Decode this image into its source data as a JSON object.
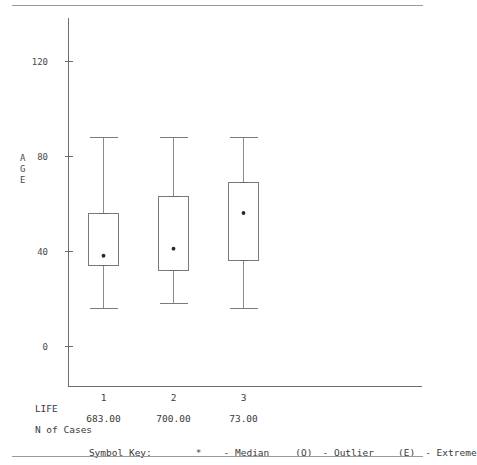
{
  "chart_data": {
    "type": "box",
    "title": "",
    "xlabel": "LIFE",
    "ylabel": "AGE",
    "ylim": [
      -10,
      133
    ],
    "yticks": [
      0,
      40,
      80,
      120
    ],
    "ytick_labels": [
      "0",
      "40",
      "80",
      "120"
    ],
    "categories": [
      "1",
      "2",
      "3"
    ],
    "grid": false,
    "legend_position": "bottom",
    "n_of_cases": [
      "683.00",
      "700.00",
      "73.00"
    ],
    "boxes": [
      {
        "category": "1",
        "whisker_low": 16,
        "q1": 34,
        "median": 38,
        "q3": 56,
        "whisker_high": 88,
        "n": "683.00"
      },
      {
        "category": "2",
        "whisker_low": 18,
        "q1": 32,
        "median": 41,
        "q3": 63,
        "whisker_high": 88,
        "n": "700.00"
      },
      {
        "category": "3",
        "whisker_low": 16,
        "q1": 36,
        "median": 56,
        "q3": 69,
        "whisker_high": 88,
        "n": "73.00"
      }
    ]
  },
  "axis": {
    "y_label_chars": [
      "A",
      "G",
      "E"
    ],
    "y_label": "AGE",
    "x_label": "LIFE"
  },
  "footer": {
    "life_label": "LIFE",
    "n_of_cases_label": "N of Cases",
    "symbol_key_label": "Symbol Key:",
    "median_symbol": "*",
    "median_text": "- Median",
    "outlier_symbol": "(O)",
    "outlier_text": "- Outlier",
    "extreme_symbol": "(E)",
    "extreme_text": "- Extreme"
  },
  "colors": {
    "line": "#7a7a7a",
    "text": "#3a3a3a",
    "rule": "#9a9a9a",
    "median_dot": "#2a2a2a"
  }
}
